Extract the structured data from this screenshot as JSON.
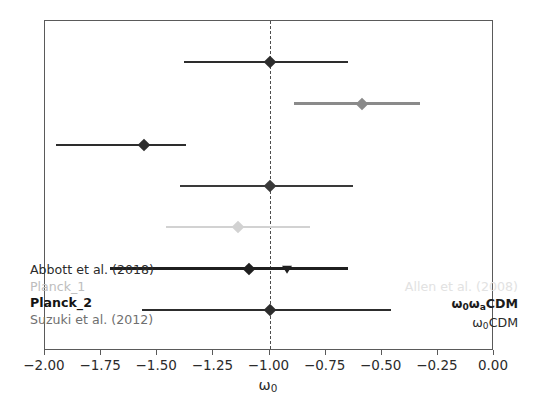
{
  "chart_data": {
    "type": "scatter",
    "title": "",
    "xlabel": "ω₀",
    "ylabel": "",
    "xlim": [
      -2.0,
      0.0
    ],
    "ylim": [
      0,
      8
    ],
    "grid": false,
    "x_ticks": [
      -2.0,
      -1.75,
      -1.5,
      -1.25,
      -1.0,
      -0.75,
      -0.5,
      -0.25,
      0.0
    ],
    "x_tick_labels": [
      "−2.00",
      "−1.75",
      "−1.50",
      "−1.25",
      "−1.00",
      "−0.75",
      "−0.50",
      "−0.25",
      "0.00"
    ],
    "reference_line": {
      "x": -1.0,
      "style": "dashed",
      "color": "#4d4d4d"
    },
    "orientation": "horizontal-error-bars",
    "points": [
      {
        "id": "row-1",
        "row": 1,
        "dataset": "Planck_2",
        "model": "ω₀CDM",
        "x": -1.0,
        "x_low": -1.38,
        "x_high": -0.65,
        "marker": "diamond",
        "color": "#2d2d2d"
      },
      {
        "id": "row-2",
        "row": 2,
        "dataset": "Suzuki et al. (2012)",
        "model": "ω₀ωₐCDM",
        "x": -0.59,
        "x_low": -0.89,
        "x_high": -0.33,
        "marker": "diamond",
        "color": "#8a8a8a"
      },
      {
        "id": "row-3",
        "row": 3,
        "dataset": "Abbott et al. (2018)",
        "model": "ω₀ωₐCDM",
        "x": -1.56,
        "x_low": -1.95,
        "x_high": -1.37,
        "marker": "diamond",
        "color": "#2d2d2d"
      },
      {
        "id": "row-4",
        "row": 4,
        "dataset": "Planck_2",
        "model": "ω₀CDM",
        "x": -1.0,
        "x_low": -1.4,
        "x_high": -0.63,
        "marker": "diamond",
        "color": "#3a3a3a"
      },
      {
        "id": "row-5",
        "row": 5,
        "dataset": "Allen et al. (2008)",
        "model": "ω₀CDM",
        "x": -1.14,
        "x_low": -1.46,
        "x_high": -0.82,
        "marker": "diamond",
        "color": "#d2d2d2"
      },
      {
        "id": "row-6",
        "row": 6,
        "dataset": "Abbott et al. (2018)",
        "model": "ω₀CDM",
        "x": -1.09,
        "x_low": -1.71,
        "x_high": -0.65,
        "marker": "diamond",
        "color": "#1f1f1f",
        "secondary": {
          "x": -0.92,
          "marker": "triangle-down",
          "color": "#1f1f1f"
        }
      },
      {
        "id": "row-7",
        "row": 7,
        "dataset": "Planck_1",
        "model": "ω₀CDM",
        "x": -1.0,
        "x_low": -1.57,
        "x_high": -0.46,
        "marker": "diamond",
        "color": "#2d2d2d"
      }
    ],
    "legend_position": "inside-bottom",
    "legend_datasets": [
      {
        "label": "Abbott et al. (2018)",
        "color": "#2b2b2b",
        "weight": "normal"
      },
      {
        "label": "Planck_1",
        "color": "#bdbdbd",
        "weight": "normal"
      },
      {
        "label": "Planck_2",
        "color": "#141414",
        "weight": "bold"
      },
      {
        "label": "Suzuki et al. (2012)",
        "color": "#6f6f6f",
        "weight": "normal"
      }
    ],
    "legend_models": [
      {
        "label": "Allen et al. (2008)",
        "color": "#e2e2e2",
        "weight": "normal",
        "html": "Allen et al. (2008)"
      },
      {
        "label": "ω₀ωₐCDM",
        "color": "#1c1c1c",
        "weight": "bold",
        "html": "&omega;<sub>0</sub>&omega;<sub>a</sub>CDM"
      },
      {
        "label": "ω₀CDM",
        "color": "#2b2b2b",
        "weight": "normal",
        "html": "&omega;<sub>0</sub>CDM"
      }
    ]
  },
  "axis": {
    "xlabel_omega": "ω",
    "xlabel_sub": "0"
  }
}
